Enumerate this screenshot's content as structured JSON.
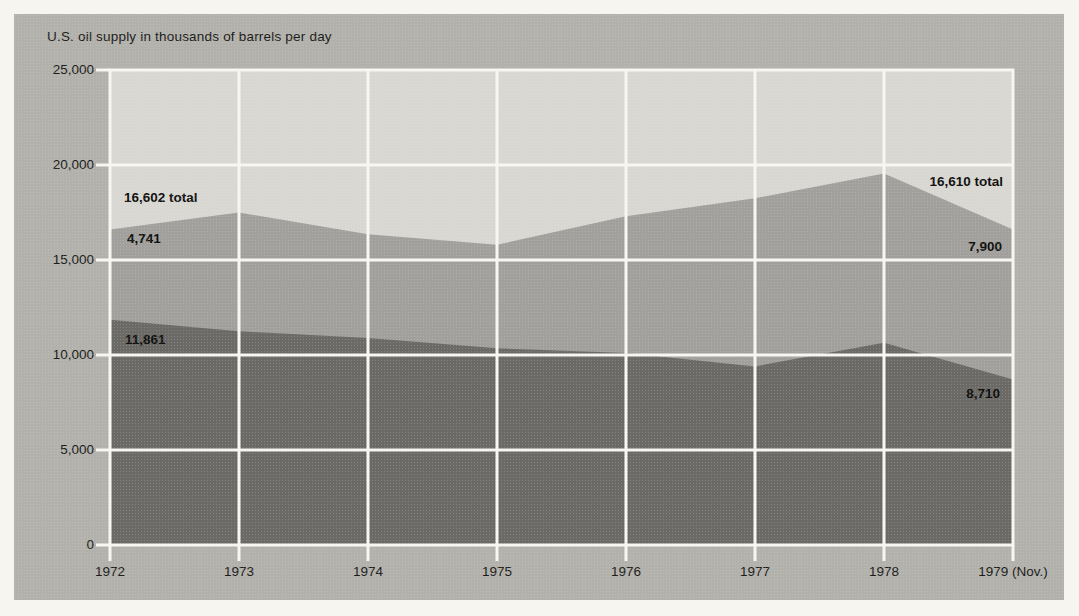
{
  "page": {
    "margin_background": "#f6f5f0",
    "panel_background": "#b2b1ac"
  },
  "chart_data": {
    "type": "area",
    "stacked": true,
    "title": "U.S. oil supply in thousands of barrels per day",
    "x_tick_labels": [
      "1972",
      "1973",
      "1974",
      "1975",
      "1976",
      "1977",
      "1978",
      "1979 (Nov.)"
    ],
    "series": [
      {
        "name": "lower band (dark gray, labeled 11,861 in 1972 and 8,710 in 1979)",
        "color": "#6b6a66",
        "values": [
          11861,
          11250,
          10900,
          10350,
          10100,
          9400,
          10650,
          8710
        ]
      },
      {
        "name": "upper band (medium gray, labeled 4,741 in 1972 and 7,900 in 1979)",
        "color": "#a1a09c",
        "values": [
          4741,
          6250,
          5450,
          5450,
          7200,
          8850,
          8900,
          7900
        ]
      }
    ],
    "stacked_totals": [
      16602,
      17500,
      16350,
      15800,
      17300,
      18250,
      19550,
      16610
    ],
    "ylim": [
      0,
      25000
    ],
    "y_ticks": [
      0,
      5000,
      10000,
      15000,
      20000,
      25000
    ],
    "y_tick_labels": [
      "0",
      "5,000",
      "10,000",
      "15,000",
      "20,000",
      "25,000"
    ],
    "grid": true,
    "grid_color": "#f7f6f1",
    "plot_background": "#d8d7d2",
    "legend": "none",
    "annotations": {
      "left_total": "16,602 total",
      "left_upper_band": "4,741",
      "left_lower_band": "11,861",
      "right_total": "16,610 total",
      "right_upper_band": "7,900",
      "right_lower_band": "8,710"
    }
  }
}
